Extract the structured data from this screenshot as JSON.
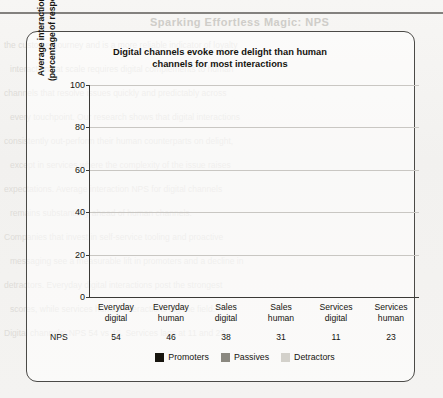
{
  "page": {
    "ghost_header": "Sparking Effortless Magic: NPS",
    "ghost_lines": [
      "the customer journey and is a more reliable indicator of loyalty",
      "interactions at scale requires digital complements to human",
      "channels that resolve issues quickly and predictably across",
      "every touchpoint. Our research shows that digital interactions",
      "consistently out-perform their human counterparts on delight,",
      "except in services where the complexity of the issue raises",
      "expectations. Average interaction NPS for digital channels",
      "remains substantially ahead of human channels.",
      "Companies that invest in self-service tooling and proactive",
      "messaging see a measurable lift in promoters and a decline in",
      "detractors. Everyday digital interactions post the strongest",
      "scores, while services human interactions lag the field.",
      "Digital channels: NPS 54 vs 46. Services lags at 11 and 23."
    ]
  },
  "chart_data": {
    "type": "bar",
    "subtype": "stacked-percentage",
    "title_lines": [
      "Digital channels evoke more delight than human",
      "channels for most interactions"
    ],
    "ylabel": "Average interaction NPS® (percentage of respondents)",
    "ylabel_lines": [
      "Average interaction NPS®",
      "(percentage of respondents)"
    ],
    "xlabel": "",
    "ylim": [
      0,
      100
    ],
    "yticks": [
      0,
      20,
      40,
      60,
      80,
      100
    ],
    "ytick_labels": [
      "0",
      "20",
      "40",
      "60",
      "80",
      "100"
    ],
    "grid": true,
    "legend_position": "bottom",
    "categories": [
      "Everyday digital",
      "Everyday human",
      "Sales digital",
      "Sales human",
      "Services digital",
      "Services human"
    ],
    "category_lines": [
      [
        "Everyday",
        "digital"
      ],
      [
        "Everyday",
        "human"
      ],
      [
        "Sales",
        "digital"
      ],
      [
        "Sales",
        "human"
      ],
      [
        "Services",
        "digital"
      ],
      [
        "Services",
        "human"
      ]
    ],
    "series": [
      {
        "name": "Promoters",
        "color": "#17150f",
        "values": [
          65,
          62,
          55,
          51,
          43,
          50
        ]
      },
      {
        "name": "Passives",
        "color": "#8a8880",
        "values": [
          25,
          24,
          28,
          31,
          25,
          23
        ]
      },
      {
        "name": "Detractors",
        "color": "#d3d1cb",
        "values": [
          10,
          14,
          17,
          18,
          32,
          27
        ]
      }
    ],
    "annotation_row": {
      "label": "NPS",
      "values": [
        "54",
        "46",
        "38",
        "31",
        "11",
        "23"
      ]
    }
  }
}
